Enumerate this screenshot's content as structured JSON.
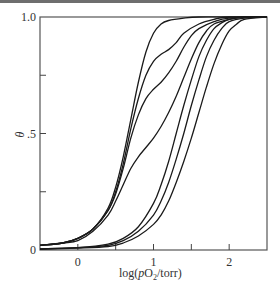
{
  "chart_data": {
    "type": "line",
    "title": "",
    "xlabel": "log(pO2/torr)",
    "ylabel": "θ",
    "xlim": [
      -0.5,
      2.5
    ],
    "ylim": [
      0,
      1.0
    ],
    "grid": false,
    "legend": null,
    "x_ticks": [
      {
        "value": 0,
        "label": "0"
      },
      {
        "value": 0.5,
        "label": ""
      },
      {
        "value": 1,
        "label": "1"
      },
      {
        "value": 1.5,
        "label": ""
      },
      {
        "value": 2,
        "label": "2"
      }
    ],
    "y_ticks": [
      {
        "value": 0,
        "label": "0"
      },
      {
        "value": 0.25,
        "label": ""
      },
      {
        "value": 0.5,
        "label": ".5"
      },
      {
        "value": 0.75,
        "label": ""
      },
      {
        "value": 1.0,
        "label": "1.0"
      }
    ],
    "series": [
      {
        "name": "curve-1",
        "x": [
          -0.5,
          -0.2,
          0,
          0.2,
          0.4,
          0.5,
          0.6,
          0.7,
          0.8,
          0.9,
          1.0,
          1.1,
          1.2,
          1.4,
          1.6,
          2.0,
          2.5
        ],
        "y": [
          0.02,
          0.03,
          0.05,
          0.09,
          0.18,
          0.27,
          0.4,
          0.56,
          0.72,
          0.85,
          0.93,
          0.97,
          0.985,
          0.995,
          1.0,
          1.0,
          1.0
        ]
      },
      {
        "name": "curve-2",
        "x": [
          -0.5,
          -0.2,
          0,
          0.2,
          0.4,
          0.5,
          0.6,
          0.7,
          0.8,
          0.9,
          1.0,
          1.1,
          1.2,
          1.3,
          1.4,
          1.6,
          1.8,
          2.0,
          2.5
        ],
        "y": [
          0.02,
          0.03,
          0.05,
          0.09,
          0.17,
          0.25,
          0.37,
          0.52,
          0.65,
          0.75,
          0.81,
          0.84,
          0.86,
          0.89,
          0.93,
          0.97,
          0.99,
          1.0,
          1.0
        ]
      },
      {
        "name": "curve-3",
        "x": [
          -0.5,
          -0.2,
          0,
          0.2,
          0.4,
          0.5,
          0.6,
          0.7,
          0.8,
          0.9,
          1.0,
          1.1,
          1.2,
          1.3,
          1.4,
          1.5,
          1.6,
          1.8,
          2.0,
          2.5
        ],
        "y": [
          0.02,
          0.03,
          0.05,
          0.09,
          0.17,
          0.24,
          0.35,
          0.48,
          0.58,
          0.65,
          0.69,
          0.72,
          0.76,
          0.81,
          0.87,
          0.92,
          0.95,
          0.98,
          0.995,
          1.0
        ]
      },
      {
        "name": "curve-4",
        "x": [
          -0.5,
          -0.2,
          0,
          0.2,
          0.4,
          0.5,
          0.6,
          0.7,
          0.8,
          0.9,
          1.0,
          1.1,
          1.2,
          1.3,
          1.4,
          1.5,
          1.6,
          1.7,
          1.8,
          2.0,
          2.2,
          2.5
        ],
        "y": [
          0.02,
          0.03,
          0.04,
          0.08,
          0.15,
          0.21,
          0.28,
          0.35,
          0.4,
          0.44,
          0.48,
          0.53,
          0.59,
          0.66,
          0.74,
          0.82,
          0.89,
          0.94,
          0.97,
          0.99,
          1.0,
          1.0
        ]
      },
      {
        "name": "curve-5",
        "x": [
          -0.5,
          0,
          0.4,
          0.6,
          0.8,
          1.0,
          1.1,
          1.2,
          1.3,
          1.4,
          1.5,
          1.6,
          1.7,
          1.8,
          1.9,
          2.0,
          2.2,
          2.5
        ],
        "y": [
          0.005,
          0.01,
          0.025,
          0.05,
          0.1,
          0.2,
          0.28,
          0.38,
          0.5,
          0.62,
          0.73,
          0.83,
          0.9,
          0.95,
          0.975,
          0.99,
          1.0,
          1.0
        ]
      },
      {
        "name": "curve-6",
        "x": [
          -0.5,
          0,
          0.4,
          0.6,
          0.8,
          1.0,
          1.1,
          1.2,
          1.3,
          1.4,
          1.5,
          1.6,
          1.7,
          1.8,
          1.9,
          2.0,
          2.2,
          2.5
        ],
        "y": [
          0.005,
          0.01,
          0.02,
          0.04,
          0.08,
          0.15,
          0.21,
          0.29,
          0.39,
          0.5,
          0.62,
          0.73,
          0.83,
          0.9,
          0.95,
          0.98,
          0.995,
          1.0
        ]
      },
      {
        "name": "curve-7",
        "x": [
          -0.5,
          0,
          0.4,
          0.6,
          0.8,
          1.0,
          1.1,
          1.2,
          1.3,
          1.4,
          1.5,
          1.6,
          1.7,
          1.8,
          1.9,
          2.0,
          2.1,
          2.2,
          2.5
        ],
        "y": [
          0.003,
          0.008,
          0.015,
          0.03,
          0.06,
          0.11,
          0.15,
          0.21,
          0.29,
          0.38,
          0.48,
          0.59,
          0.7,
          0.8,
          0.88,
          0.94,
          0.97,
          0.99,
          1.0
        ]
      }
    ],
    "plot_box_px": {
      "left": 40,
      "top": 17,
      "right": 267,
      "bottom": 250
    }
  },
  "labels": {
    "y_axis_title": "θ",
    "x_axis_title_prefix": "log(",
    "x_axis_title_italic": "p",
    "x_axis_title_main": "O",
    "x_axis_title_sub": "2",
    "x_axis_title_suffix": "/torr)"
  }
}
